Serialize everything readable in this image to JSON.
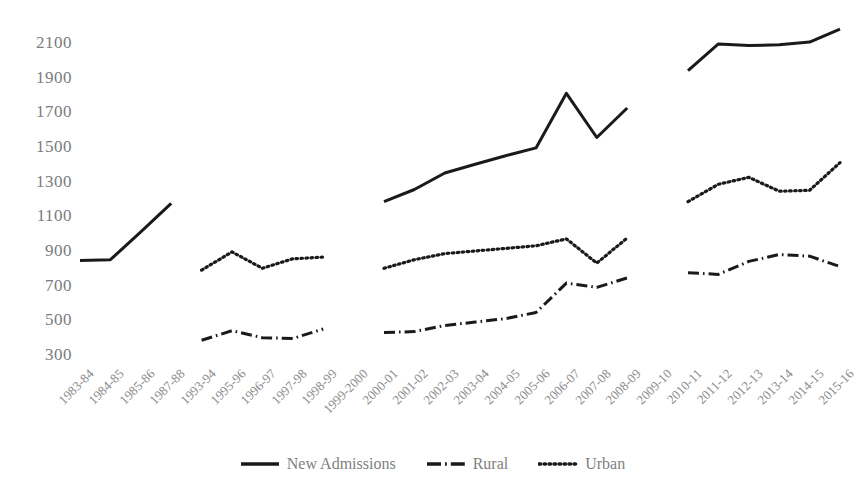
{
  "chart_data": {
    "type": "line",
    "title": "",
    "xlabel": "",
    "ylabel": "",
    "ylim": [
      300,
      2100
    ],
    "ytick_step": 200,
    "grid": false,
    "legend_position": "bottom",
    "categories": [
      "1983-84",
      "1984-85",
      "1985-86",
      "1987-88",
      "1993-94",
      "1995-96",
      "1996-97",
      "1997-98",
      "1998-99",
      "1999-2000",
      "2000-01",
      "2001-02",
      "2002-03",
      "2003-04",
      "2004-05",
      "2005-06",
      "2006-07",
      "2007-08",
      "2008-09",
      "2009-10",
      "2010-11",
      "2011-12",
      "2012-13",
      "2013-14",
      "2014-15",
      "2015-16"
    ],
    "yticks": [
      "2100",
      "1900",
      "1700",
      "1500",
      "1300",
      "1100",
      "900",
      "700",
      "500",
      "300"
    ],
    "series": [
      {
        "name": "New Admissions",
        "style": "solid",
        "color": "#1a1a1a",
        "values": [
          845,
          850,
          1010,
          1175,
          null,
          null,
          null,
          null,
          null,
          null,
          1185,
          1255,
          1350,
          1400,
          1450,
          1495,
          1810,
          1555,
          1725,
          null,
          1940,
          2095,
          2085,
          2090,
          2105,
          2180
        ]
      },
      {
        "name": "Rural",
        "style": "dash-dot",
        "color": "#1a1a1a",
        "values": [
          null,
          null,
          null,
          null,
          385,
          440,
          400,
          395,
          450,
          null,
          430,
          435,
          470,
          490,
          510,
          545,
          715,
          690,
          745,
          null,
          775,
          765,
          840,
          880,
          870,
          810
        ]
      },
      {
        "name": "Urban",
        "style": "dotted",
        "color": "#1a1a1a",
        "values": [
          null,
          null,
          null,
          null,
          790,
          895,
          800,
          855,
          865,
          null,
          800,
          850,
          885,
          900,
          915,
          930,
          970,
          830,
          975,
          null,
          1185,
          1285,
          1325,
          1245,
          1250,
          1410
        ]
      }
    ]
  },
  "legend": {
    "items": [
      {
        "label": "New Admissions",
        "marker": "solid-line-icon"
      },
      {
        "label": "Rural",
        "marker": "dash-dot-line-icon"
      },
      {
        "label": "Urban",
        "marker": "dotted-line-icon"
      }
    ]
  }
}
